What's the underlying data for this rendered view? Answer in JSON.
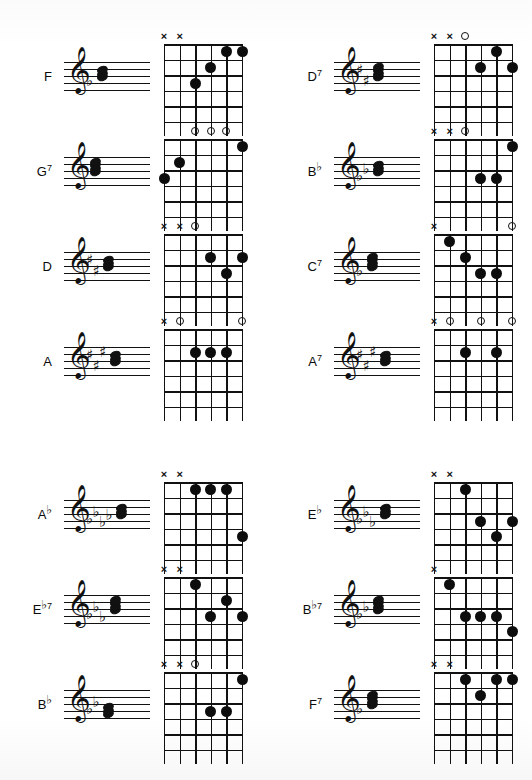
{
  "page": {
    "background_color": "#ffffff",
    "ink_color": "#111111",
    "columns": 2,
    "sections": 2
  },
  "symbols": {
    "mute": "×",
    "open": "O",
    "flat": "♭",
    "sharp": "♯",
    "natural": "♮",
    "treble_clef": "𝄞",
    "seventh": "7"
  },
  "fretboard": {
    "strings": 6,
    "frets": 5,
    "string_order": "low-to-high-left-to-right"
  },
  "chords": [
    {
      "id": "f-major",
      "name_root": "F",
      "name_accidental": "",
      "name_quality": "",
      "label_full": "F",
      "section": 1,
      "column": "left",
      "row": 1,
      "key_signature": {
        "type": "flat",
        "count": 1
      },
      "notes_count": 3,
      "markers": [
        {
          "string": 1,
          "symbol": "×"
        },
        {
          "string": 2,
          "symbol": "×"
        }
      ],
      "dots": [
        {
          "string": 3,
          "fret": 3
        },
        {
          "string": 4,
          "fret": 2
        },
        {
          "string": 5,
          "fret": 1
        },
        {
          "string": 6,
          "fret": 1
        }
      ]
    },
    {
      "id": "g7",
      "name_root": "G",
      "name_accidental": "",
      "name_quality": "7",
      "label_full": "G7",
      "section": 1,
      "column": "left",
      "row": 2,
      "key_signature": {
        "type": "none",
        "count": 0
      },
      "notes_count": 4,
      "markers": [
        {
          "string": 3,
          "symbol": "O"
        },
        {
          "string": 4,
          "symbol": "O"
        },
        {
          "string": 5,
          "symbol": "O"
        }
      ],
      "dots": [
        {
          "string": 1,
          "fret": 3
        },
        {
          "string": 2,
          "fret": 2
        },
        {
          "string": 6,
          "fret": 1
        }
      ]
    },
    {
      "id": "d-major",
      "name_root": "D",
      "name_accidental": "",
      "name_quality": "",
      "label_full": "D",
      "section": 1,
      "column": "left",
      "row": 3,
      "key_signature": {
        "type": "sharp",
        "count": 2
      },
      "notes_count": 3,
      "markers": [
        {
          "string": 1,
          "symbol": "×"
        },
        {
          "string": 2,
          "symbol": "×"
        },
        {
          "string": 3,
          "symbol": "O"
        }
      ],
      "dots": [
        {
          "string": 4,
          "fret": 2
        },
        {
          "string": 6,
          "fret": 2
        },
        {
          "string": 5,
          "fret": 3
        }
      ]
    },
    {
      "id": "a-major",
      "name_root": "A",
      "name_accidental": "",
      "name_quality": "",
      "label_full": "A",
      "section": 1,
      "column": "left",
      "row": 4,
      "key_signature": {
        "type": "sharp",
        "count": 3
      },
      "notes_count": 3,
      "markers": [
        {
          "string": 1,
          "symbol": "×"
        },
        {
          "string": 2,
          "symbol": "O"
        },
        {
          "string": 6,
          "symbol": "O"
        }
      ],
      "dots": [
        {
          "string": 3,
          "fret": 2
        },
        {
          "string": 4,
          "fret": 2
        },
        {
          "string": 5,
          "fret": 2
        }
      ]
    },
    {
      "id": "d7",
      "name_root": "D",
      "name_accidental": "",
      "name_quality": "7",
      "label_full": "D7",
      "section": 1,
      "column": "right",
      "row": 1,
      "key_signature": {
        "type": "sharp",
        "count": 2
      },
      "notes_count": 4,
      "markers": [
        {
          "string": 1,
          "symbol": "×"
        },
        {
          "string": 2,
          "symbol": "×"
        },
        {
          "string": 3,
          "symbol": "O"
        }
      ],
      "dots": [
        {
          "string": 5,
          "fret": 1
        },
        {
          "string": 4,
          "fret": 2
        },
        {
          "string": 6,
          "fret": 2
        }
      ]
    },
    {
      "id": "b-flat",
      "name_root": "B",
      "name_accidental": "♭",
      "name_quality": "",
      "label_full": "B♭",
      "section": 1,
      "column": "right",
      "row": 2,
      "key_signature": {
        "type": "flat",
        "count": 2
      },
      "notes_count": 3,
      "markers": [
        {
          "string": 1,
          "symbol": "×"
        },
        {
          "string": 2,
          "symbol": "×"
        },
        {
          "string": 3,
          "symbol": "O"
        }
      ],
      "dots": [
        {
          "string": 6,
          "fret": 1
        },
        {
          "string": 4,
          "fret": 3
        },
        {
          "string": 5,
          "fret": 3
        }
      ]
    },
    {
      "id": "c7",
      "name_root": "C",
      "name_accidental": "",
      "name_quality": "7",
      "label_full": "C7",
      "section": 1,
      "column": "right",
      "row": 3,
      "key_signature": {
        "type": "flat",
        "count": 1
      },
      "notes_count": 4,
      "markers": [
        {
          "string": 1,
          "symbol": "×"
        },
        {
          "string": 6,
          "symbol": "O"
        }
      ],
      "dots": [
        {
          "string": 2,
          "fret": 1
        },
        {
          "string": 5,
          "fret": 3
        },
        {
          "string": 3,
          "fret": 2
        },
        {
          "string": 4,
          "fret": 3
        }
      ]
    },
    {
      "id": "a7",
      "name_root": "A",
      "name_accidental": "",
      "name_quality": "7",
      "label_full": "A7",
      "section": 1,
      "column": "right",
      "row": 4,
      "key_signature": {
        "type": "sharp",
        "count": 3
      },
      "notes_count": 3,
      "markers": [
        {
          "string": 1,
          "symbol": "×"
        },
        {
          "string": 2,
          "symbol": "O"
        },
        {
          "string": 4,
          "symbol": "O"
        },
        {
          "string": 6,
          "symbol": "O"
        }
      ],
      "dots": [
        {
          "string": 3,
          "fret": 2
        },
        {
          "string": 5,
          "fret": 2
        }
      ]
    },
    {
      "id": "a-flat",
      "name_root": "A",
      "name_accidental": "♭",
      "name_quality": "",
      "label_full": "A♭",
      "section": 2,
      "column": "left",
      "row": 1,
      "key_signature": {
        "type": "flat",
        "count": 4
      },
      "notes_count": 3,
      "markers": [
        {
          "string": 1,
          "symbol": "×"
        },
        {
          "string": 2,
          "symbol": "×"
        }
      ],
      "dots": [
        {
          "string": 3,
          "fret": 1
        },
        {
          "string": 4,
          "fret": 1
        },
        {
          "string": 5,
          "fret": 1
        },
        {
          "string": 6,
          "fret": 4
        }
      ]
    },
    {
      "id": "e-flat-7",
      "name_root": "E",
      "name_accidental": "♭",
      "name_quality": "7",
      "label_full": "E♭7",
      "section": 2,
      "column": "left",
      "row": 2,
      "key_signature": {
        "type": "flat",
        "count": 3
      },
      "notes_count": 4,
      "markers": [
        {
          "string": 1,
          "symbol": "×"
        },
        {
          "string": 2,
          "symbol": "×"
        }
      ],
      "dots": [
        {
          "string": 3,
          "fret": 1
        },
        {
          "string": 5,
          "fret": 2
        },
        {
          "string": 4,
          "fret": 3
        },
        {
          "string": 6,
          "fret": 3
        }
      ]
    },
    {
      "id": "b-flat-low",
      "name_root": "B",
      "name_accidental": "♭",
      "name_quality": "",
      "label_full": "B♭",
      "section": 2,
      "column": "left",
      "row": 3,
      "key_signature": {
        "type": "flat",
        "count": 2
      },
      "notes_count": 3,
      "markers": [
        {
          "string": 1,
          "symbol": "×"
        },
        {
          "string": 2,
          "symbol": "×"
        },
        {
          "string": 3,
          "symbol": "O"
        }
      ],
      "dots": [
        {
          "string": 6,
          "fret": 1
        },
        {
          "string": 4,
          "fret": 3
        },
        {
          "string": 5,
          "fret": 3
        }
      ]
    },
    {
      "id": "e-flat",
      "name_root": "E",
      "name_accidental": "♭",
      "name_quality": "",
      "label_full": "E♭",
      "section": 2,
      "column": "right",
      "row": 1,
      "key_signature": {
        "type": "flat",
        "count": 3
      },
      "notes_count": 3,
      "markers": [
        {
          "string": 1,
          "symbol": "×"
        },
        {
          "string": 2,
          "symbol": "×"
        }
      ],
      "dots": [
        {
          "string": 3,
          "fret": 1
        },
        {
          "string": 4,
          "fret": 3
        },
        {
          "string": 6,
          "fret": 3
        },
        {
          "string": 5,
          "fret": 4
        }
      ]
    },
    {
      "id": "b-flat-7",
      "name_root": "B",
      "name_accidental": "♭",
      "name_quality": "7",
      "label_full": "B♭7",
      "section": 2,
      "column": "right",
      "row": 2,
      "key_signature": {
        "type": "flat",
        "count": 2
      },
      "notes_count": 4,
      "markers": [
        {
          "string": 1,
          "symbol": "×"
        }
      ],
      "dots": [
        {
          "string": 2,
          "fret": 1
        },
        {
          "string": 3,
          "fret": 3
        },
        {
          "string": 4,
          "fret": 3
        },
        {
          "string": 5,
          "fret": 3
        },
        {
          "string": 6,
          "fret": 4
        }
      ]
    },
    {
      "id": "f7",
      "name_root": "F",
      "name_accidental": "",
      "name_quality": "7",
      "label_full": "F7",
      "section": 2,
      "column": "right",
      "row": 3,
      "key_signature": {
        "type": "flat",
        "count": 1
      },
      "notes_count": 4,
      "markers": [
        {
          "string": 1,
          "symbol": "×"
        },
        {
          "string": 2,
          "symbol": "×"
        }
      ],
      "dots": [
        {
          "string": 3,
          "fret": 1
        },
        {
          "string": 5,
          "fret": 1
        },
        {
          "string": 6,
          "fret": 1
        },
        {
          "string": 4,
          "fret": 2
        }
      ]
    }
  ]
}
